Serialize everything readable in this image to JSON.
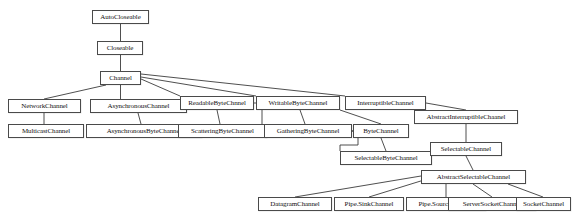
{
  "diagram": {
    "kind": "class-hierarchy",
    "background_color": "#ffffff",
    "box_border_color": "#4a4a4a",
    "box_fill_color": "#ffffff",
    "edge_color": "#3b3b3b",
    "text_color": "#111111",
    "nodes": [
      {
        "id": "auto_closeable",
        "label": "AutoCloseable",
        "x": 92,
        "y": 10,
        "w": 57,
        "h": 14,
        "font_size": 7.0
      },
      {
        "id": "closeable",
        "label": "Closeable",
        "x": 97,
        "y": 41,
        "w": 46,
        "h": 14,
        "font_size": 7.0
      },
      {
        "id": "channel",
        "label": "Channel",
        "x": 100,
        "y": 71,
        "w": 41,
        "h": 14,
        "font_size": 7.0
      },
      {
        "id": "network_channel",
        "label": "NetworkChannel",
        "x": 8,
        "y": 99,
        "w": 73,
        "h": 14,
        "font_size": 7.0
      },
      {
        "id": "multicast_channel",
        "label": "MulticastChannel",
        "x": 8,
        "y": 124,
        "w": 76,
        "h": 14,
        "font_size": 7.0
      },
      {
        "id": "asynchronous_channel",
        "label": "AsynchronousChannel",
        "x": 90,
        "y": 99,
        "w": 97,
        "h": 14,
        "font_size": 7.0
      },
      {
        "id": "asynchronous_byte_channel",
        "label": "AsynchronousByteChannel",
        "x": 86,
        "y": 124,
        "w": 116,
        "h": 14,
        "font_size": 7.0
      },
      {
        "id": "readable_byte_channel",
        "label": "ReadableByteChnnel",
        "x": 180,
        "y": 96,
        "w": 74,
        "h": 14,
        "font_size": 7.0
      },
      {
        "id": "scattering_byte_channel",
        "label": "ScatteringByteChannel",
        "x": 178,
        "y": 124,
        "w": 89,
        "h": 14,
        "font_size": 7.0
      },
      {
        "id": "writable_byte_channel",
        "label": "WritableByteChannel",
        "x": 256,
        "y": 96,
        "w": 84,
        "h": 14,
        "font_size": 7.0
      },
      {
        "id": "gathering_byte_channel",
        "label": "GatheringByteChannel",
        "x": 264,
        "y": 124,
        "w": 88,
        "h": 14,
        "font_size": 7.0
      },
      {
        "id": "interruptible_channel",
        "label": "InterruptibleChannel",
        "x": 345,
        "y": 96,
        "w": 81,
        "h": 14,
        "font_size": 7.0
      },
      {
        "id": "byte_channel",
        "label": "ByteChannel",
        "x": 353,
        "y": 124,
        "w": 56,
        "h": 14,
        "font_size": 7.0
      },
      {
        "id": "selectable_byte_channel",
        "label": "SelectableByteChannel",
        "x": 340,
        "y": 151,
        "w": 92,
        "h": 14,
        "font_size": 7.0
      },
      {
        "id": "abstract_interruptible",
        "label": "AbstractInterruptibleChaanel",
        "x": 414,
        "y": 110,
        "w": 104,
        "h": 14,
        "font_size": 7.0
      },
      {
        "id": "selectable_channel",
        "label": "SelectableChannel",
        "x": 430,
        "y": 142,
        "w": 72,
        "h": 14,
        "font_size": 7.0
      },
      {
        "id": "abstract_selectable_channel",
        "label": "AbstractSelectableChannel",
        "x": 421,
        "y": 170,
        "w": 105,
        "h": 14,
        "font_size": 7.0
      },
      {
        "id": "datagram_channel",
        "label": "DatagramChannel",
        "x": 258,
        "y": 197,
        "w": 74,
        "h": 14,
        "font_size": 7.0
      },
      {
        "id": "pipe_sink_channel",
        "label": "Pipe.SinkChannel",
        "x": 334,
        "y": 197,
        "w": 70,
        "h": 14,
        "font_size": 7.0
      },
      {
        "id": "pipe_source_channel",
        "label": "Pipe.SourceChannel",
        "x": 406,
        "y": 197,
        "w": 80,
        "h": 14,
        "font_size": 7.0
      },
      {
        "id": "server_socket_channel",
        "label": "ServerSocketChannel",
        "x": 448,
        "y": 197,
        "w": 88,
        "h": 14,
        "font_size": 7.0
      },
      {
        "id": "socket_channel",
        "label": "SocketChannel",
        "x": 516,
        "y": 197,
        "w": 55,
        "h": 14,
        "font_size": 7.0
      }
    ],
    "edges": [
      {
        "from": "auto_closeable",
        "to": "closeable",
        "points": "120.5,24 120.5,41"
      },
      {
        "from": "closeable",
        "to": "channel",
        "points": "120.5,55 120.5,71"
      },
      {
        "from": "channel",
        "to": "network_channel",
        "points": "106,85 44,99"
      },
      {
        "from": "channel",
        "to": "asynchronous_channel",
        "points": "120.5,85 120.5,99"
      },
      {
        "from": "channel",
        "to": "readable_byte_channel",
        "points": "141,79 180,96"
      },
      {
        "from": "channel",
        "to": "writable_byte_channel",
        "points": "141,77 256,96"
      },
      {
        "from": "channel",
        "to": "interruptible_channel",
        "points": "141,74 345,96"
      },
      {
        "from": "network_channel",
        "to": "multicast_channel",
        "points": "44,113 44,124"
      },
      {
        "from": "asynchronous_channel",
        "to": "asynchronous_byte_channel",
        "points": "138,113 141,124"
      },
      {
        "from": "readable_byte_channel",
        "to": "scattering_byte_channel",
        "points": "217,110 220,124"
      },
      {
        "from": "readable_byte_channel",
        "to": "byte_channel",
        "points": "254,103 262,103 262,131 353,131"
      },
      {
        "from": "writable_byte_channel",
        "to": "gathering_byte_channel",
        "points": "300,110 305,124"
      },
      {
        "from": "writable_byte_channel",
        "to": "byte_channel",
        "points": "340,110 381,124"
      },
      {
        "from": "byte_channel",
        "to": "selectable_byte_channel",
        "points": "381,138 386,151"
      },
      {
        "from": "gathering_byte_channel",
        "to": "selectable_byte_channel",
        "points": "352,131 358,131 358,145 340,145 340,151"
      },
      {
        "from": "interruptible_channel",
        "to": "abstract_interruptible",
        "points": "426,103 466,110"
      },
      {
        "from": "abstract_interruptible",
        "to": "selectable_channel",
        "points": "466,124 466,142"
      },
      {
        "from": "selectable_channel",
        "to": "abstract_selectable_channel",
        "points": "466,156 473,170"
      },
      {
        "from": "abstract_selectable_channel",
        "to": "datagram_channel",
        "points": "421,176 295,197"
      },
      {
        "from": "abstract_selectable_channel",
        "to": "pipe_sink_channel",
        "points": "424,180 369,197"
      },
      {
        "from": "abstract_selectable_channel",
        "to": "pipe_source_channel",
        "points": "446,184 446,197"
      },
      {
        "from": "abstract_selectable_channel",
        "to": "server_socket_channel",
        "points": "473,184 492,197"
      },
      {
        "from": "abstract_selectable_channel",
        "to": "socket_channel",
        "points": "508,184 543,197"
      }
    ]
  }
}
